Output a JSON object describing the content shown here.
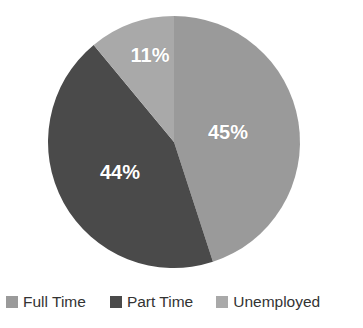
{
  "chart_data": {
    "type": "pie",
    "title": "",
    "subtitle": "",
    "xlabel": "",
    "ylabel": "",
    "grid": false,
    "legend_position": "bottom",
    "start_angle_deg": 0,
    "direction": "clockwise",
    "categories": [
      "Full Time",
      "Part Time",
      "Unemployed"
    ],
    "values": [
      45,
      44,
      11
    ],
    "value_unit": "%",
    "data_labels": [
      "45%",
      "44%",
      "11%"
    ],
    "colors": [
      "#9a9a9a",
      "#4a4a4a",
      "#a9a9a9"
    ],
    "slices": [
      {
        "label": "Full Time",
        "value": 45,
        "data_label": "45%",
        "color": "#9a9a9a",
        "start_angle_deg": 0,
        "end_angle_deg": 162
      },
      {
        "label": "Part Time",
        "value": 44,
        "data_label": "44%",
        "color": "#4a4a4a",
        "start_angle_deg": 162,
        "end_angle_deg": 320.4
      },
      {
        "label": "Unemployed",
        "value": 11,
        "data_label": "11%",
        "color": "#a9a9a9",
        "start_angle_deg": 320.4,
        "end_angle_deg": 360
      }
    ]
  },
  "geometry": {
    "center_x": 174,
    "center_y": 142,
    "radius": 126,
    "label_positions": [
      {
        "x": 228,
        "y": 132
      },
      {
        "x": 120,
        "y": 172
      },
      {
        "x": 150,
        "y": 55
      }
    ]
  },
  "legend": {
    "items": [
      {
        "label": "Full Time",
        "color": "#9a9a9a"
      },
      {
        "label": "Part Time",
        "color": "#4a4a4a"
      },
      {
        "label": "Unemployed",
        "color": "#a9a9a9"
      }
    ]
  },
  "canvas": {
    "background": "#ffffff",
    "label_text_color": "#ffffff",
    "legend_text_color": "#333333"
  }
}
